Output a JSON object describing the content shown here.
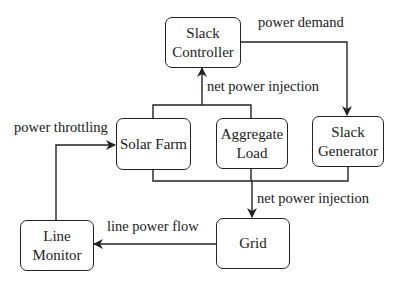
{
  "diagram": {
    "nodes": {
      "slack_controller": {
        "line1": "Slack",
        "line2": "Controller"
      },
      "solar_farm": {
        "label": "Solar Farm"
      },
      "aggregate_load": {
        "line1": "Aggregate",
        "line2": "Load"
      },
      "slack_generator": {
        "line1": "Slack",
        "line2": "Generator"
      },
      "line_monitor": {
        "line1": "Line",
        "line2": "Monitor"
      },
      "grid": {
        "label": "Grid"
      }
    },
    "edges": {
      "power_demand": "power demand",
      "net_power_injection_top": "net power injection",
      "power_throttling": "power throttling",
      "net_power_injection_bottom": "net power injection",
      "line_power_flow": "line power flow"
    },
    "colors": {
      "stroke": "#222222",
      "background": "#ffffff"
    }
  }
}
